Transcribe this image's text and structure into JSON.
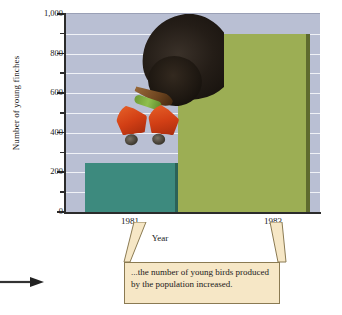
{
  "chart_data": {
    "type": "bar",
    "title": "",
    "xlabel": "Year",
    "ylabel": "Number of young finches",
    "categories": [
      "1981",
      "1983"
    ],
    "values": [
      250,
      900
    ],
    "ylim": [
      0,
      1000
    ],
    "y_major_ticks": [
      0,
      200,
      400,
      600,
      800,
      1000
    ],
    "y_tick_labels": [
      "0",
      "200",
      "400",
      "600",
      "800",
      "1,000"
    ],
    "y_minor_ticks": [
      100,
      300,
      500,
      700,
      900
    ],
    "grid": true,
    "legend": "none",
    "series": [
      {
        "name": "Number of young finches",
        "values": [
          250,
          900
        ]
      }
    ],
    "bar_colors": [
      "#3d8a7e",
      "#9cae54"
    ],
    "plot_background": "#b9bfd3",
    "gridline_color": "#f0f2f7"
  },
  "axes": {
    "y_title": "Number of young finches",
    "x_title": "Year",
    "y_labels": [
      "1,000",
      "800",
      "600",
      "400",
      "200",
      "0"
    ],
    "x_labels": [
      "1981",
      "1983"
    ]
  },
  "callout": {
    "text": "...the number of young birds produced by the population increased.",
    "background": "#f6e7c6",
    "border": "#8a7a52"
  },
  "photo": {
    "caption": "adult black finch feeding a green caterpillar to two orange-gaped chicks",
    "adult_color": "#1d1711",
    "chick_color": "#d2501a",
    "caterpillar_color": "#7aa83d"
  },
  "annotations": {
    "left_arrow": "→"
  }
}
